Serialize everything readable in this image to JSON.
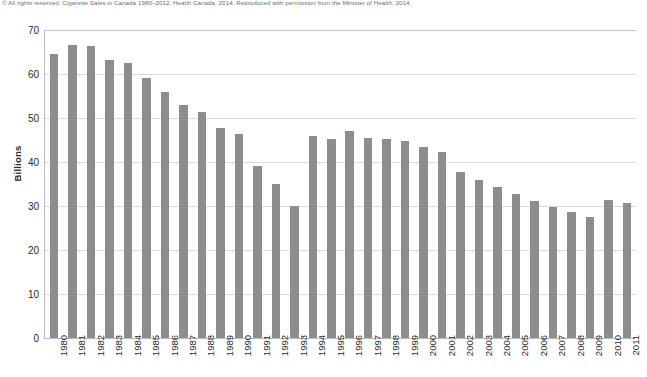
{
  "credit": {
    "text": "© All rights reserved. Cigarette Sales in Canada 1980–2012. Health Canada, 2014. Reproduced with permission from the Minister of Health, 2014."
  },
  "colors": {
    "bar": "#8b8d8f",
    "grid": "#d9dbdd",
    "axis": "#b9bcc0",
    "text": "#2b2b2b",
    "credit_text": "#6c6f73",
    "background": "#ffffff"
  },
  "chart_data": {
    "type": "bar",
    "title": "",
    "subtitle": "",
    "xlabel": "",
    "ylabel": "Billions",
    "ylim": [
      0,
      70
    ],
    "yticks": [
      0,
      10,
      20,
      30,
      40,
      50,
      60,
      70
    ],
    "ytick_labels": [
      "0",
      "10",
      "20",
      "30",
      "40",
      "50",
      "60",
      "70"
    ],
    "grid": "horizontal",
    "legend": null,
    "legend_position": "none",
    "categories": [
      "1980",
      "1981",
      "1982",
      "1983",
      "1984",
      "1985",
      "1986",
      "1987",
      "1988",
      "1989",
      "1990",
      "1991",
      "1992",
      "1993",
      "1994",
      "1995",
      "1996",
      "1997",
      "1998",
      "1999",
      "2000",
      "2001",
      "2002",
      "2003",
      "2004",
      "2005",
      "2006",
      "2007",
      "2008",
      "2009",
      "2010",
      "2011"
    ],
    "values": [
      64.5,
      66.5,
      66.3,
      63.2,
      62.5,
      59.2,
      55.8,
      53.0,
      51.3,
      47.8,
      46.3,
      39.0,
      35.0,
      30.0,
      45.8,
      45.2,
      47.0,
      45.5,
      45.3,
      44.7,
      43.5,
      42.2,
      37.8,
      35.8,
      34.3,
      32.8,
      31.2,
      29.7,
      28.6,
      27.5,
      31.4,
      30.7
    ]
  }
}
